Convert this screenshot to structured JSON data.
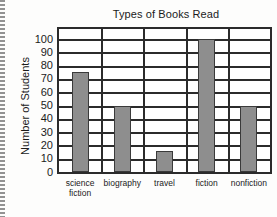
{
  "chart_data": {
    "type": "bar",
    "title": "Types of Books Read",
    "xlabel": "",
    "ylabel": "Number of Students",
    "categories": [
      "science fiction",
      "biography",
      "travel",
      "fiction",
      "nonfiction"
    ],
    "category_labels": [
      "science\nfiction",
      "biography",
      "travel",
      "fiction",
      "nonfiction"
    ],
    "values": [
      75,
      50,
      16,
      100,
      50
    ],
    "ylim": [
      0,
      100
    ],
    "ytick_labels": [
      "100",
      "90",
      "80",
      "70",
      "60",
      "50",
      "40",
      "30",
      "20",
      "10",
      "0"
    ],
    "ytick_values": [
      100,
      90,
      80,
      70,
      60,
      50,
      40,
      30,
      20,
      10,
      0
    ],
    "ytick_step": 10,
    "grid": true,
    "grid_orientation": "both",
    "legend": "none",
    "bar_color": "#8e8e8e",
    "bar_edge_color": "#3a3a3a",
    "axis_color": "#2b2b2b",
    "background_color": "#ffffff"
  },
  "axis": {
    "y_title": "Number of Students"
  }
}
